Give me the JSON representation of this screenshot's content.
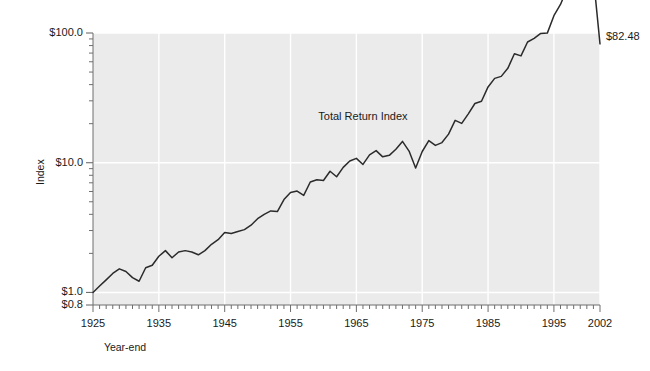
{
  "chart_data": {
    "type": "line",
    "title": "",
    "xlabel": "Year-end",
    "ylabel": "Index",
    "yscale": "log",
    "ylim": [
      0.8,
      100.0
    ],
    "xlim": [
      1925,
      2002
    ],
    "grid": true,
    "legend_position": "inline-annotation",
    "series": [
      {
        "name": "Total Return Index",
        "x": [
          1925,
          1926,
          1927,
          1928,
          1929,
          1930,
          1931,
          1932,
          1933,
          1934,
          1935,
          1936,
          1937,
          1938,
          1939,
          1940,
          1941,
          1942,
          1943,
          1944,
          1945,
          1946,
          1947,
          1948,
          1949,
          1950,
          1951,
          1952,
          1953,
          1954,
          1955,
          1956,
          1957,
          1958,
          1959,
          1960,
          1961,
          1962,
          1963,
          1964,
          1965,
          1966,
          1967,
          1968,
          1969,
          1970,
          1971,
          1972,
          1973,
          1974,
          1975,
          1976,
          1977,
          1978,
          1979,
          1980,
          1981,
          1982,
          1983,
          1984,
          1985,
          1986,
          1987,
          1988,
          1989,
          1990,
          1991,
          1992,
          1993,
          1994,
          1995,
          1996,
          1997,
          1998,
          1999,
          2000,
          2001,
          2002
        ],
        "values": [
          1.0,
          1.12,
          1.25,
          1.4,
          1.52,
          1.45,
          1.3,
          1.22,
          1.55,
          1.62,
          1.9,
          2.1,
          1.85,
          2.05,
          2.1,
          2.05,
          1.95,
          2.1,
          2.35,
          2.55,
          2.9,
          2.85,
          2.95,
          3.05,
          3.3,
          3.7,
          4.0,
          4.25,
          4.2,
          5.2,
          5.9,
          6.05,
          5.6,
          7.1,
          7.4,
          7.3,
          8.6,
          7.8,
          9.2,
          10.3,
          10.8,
          9.7,
          11.5,
          12.4,
          11.1,
          11.4,
          12.7,
          14.6,
          12.3,
          9.1,
          12.2,
          14.8,
          13.6,
          14.3,
          16.6,
          21.2,
          20.1,
          23.8,
          28.6,
          29.8,
          38.4,
          44.7,
          46.3,
          53.4,
          69.2,
          66.6,
          85.2,
          90.8,
          99.2,
          99.8,
          136.0,
          166.0,
          219.0,
          280.0,
          337.0,
          305.0,
          268.0,
          82.48
        ]
      }
    ],
    "y_ticks": [
      {
        "value": 0.8,
        "label": "$0.8"
      },
      {
        "value": 1.0,
        "label": "$1.0"
      },
      {
        "value": 10.0,
        "label": "$10.0"
      },
      {
        "value": 100.0,
        "label": "$100.0"
      }
    ],
    "x_ticks": [
      {
        "value": 1925,
        "label": "1925"
      },
      {
        "value": 1935,
        "label": "1935"
      },
      {
        "value": 1945,
        "label": "1945"
      },
      {
        "value": 1955,
        "label": "1955"
      },
      {
        "value": 1965,
        "label": "1965"
      },
      {
        "value": 1975,
        "label": "1975"
      },
      {
        "value": 1985,
        "label": "1985"
      },
      {
        "value": 1995,
        "label": "1995"
      },
      {
        "value": 2002,
        "label": "2002"
      }
    ],
    "annotations": [
      {
        "name": "series-inline-label",
        "text": "Total Return Index",
        "x": 1966,
        "y": 22.0
      },
      {
        "name": "endpoint-value-label",
        "text": "$82.48",
        "x": 2002,
        "y": 82.48
      }
    ],
    "colors": {
      "plot_background": "#ebebeb",
      "gridline": "#ffffff",
      "series_line": "#2b2b2b",
      "axis": "#6e6e6e",
      "text": "#1a1a1a"
    }
  }
}
